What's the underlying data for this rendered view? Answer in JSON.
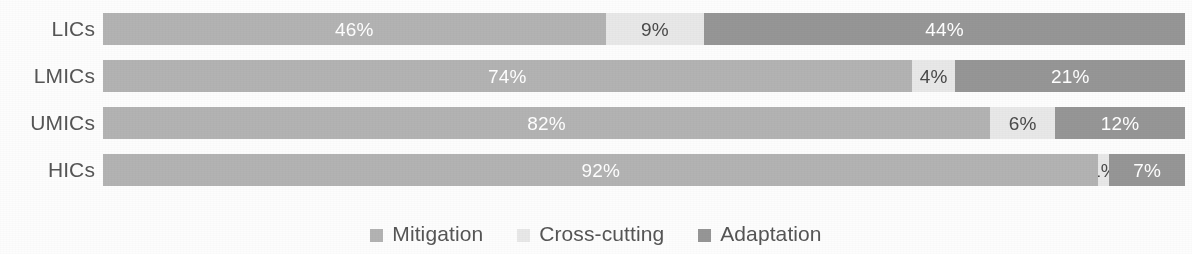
{
  "chart_data": {
    "type": "bar",
    "orientation": "horizontal",
    "stacked": true,
    "normalized_percent": true,
    "title": "",
    "subtitle": "",
    "xlabel": "",
    "ylabel": "",
    "xlim": [
      0,
      100
    ],
    "grid": false,
    "legend_position": "bottom-center",
    "categories": [
      "LICs",
      "LMICs",
      "UMICs",
      "HICs"
    ],
    "series": [
      {
        "name": "Mitigation",
        "color": "#b3b3b3",
        "values": [
          46,
          74,
          82,
          92
        ]
      },
      {
        "name": "Cross-cutting",
        "color": "#e8e8e8",
        "values": [
          9,
          4,
          6,
          1
        ]
      },
      {
        "name": "Adaptation",
        "color": "#969696",
        "values": [
          44,
          21,
          12,
          7
        ]
      }
    ],
    "data_labels": [
      {
        "category": "LICs",
        "labels": [
          "46%",
          "9%",
          "44%"
        ]
      },
      {
        "category": "LMICs",
        "labels": [
          "74%",
          "4%",
          "21%"
        ]
      },
      {
        "category": "UMICs",
        "labels": [
          "82%",
          "6%",
          "12%"
        ]
      },
      {
        "category": "HICs",
        "labels": [
          "92%",
          "1%",
          "7%"
        ]
      }
    ]
  },
  "rows": [
    {
      "label": "LICs",
      "segments": [
        {
          "series": "Mitigation",
          "value": 46,
          "label": "46%",
          "color": "#b3b3b3",
          "label_color": "light",
          "label_visible": true
        },
        {
          "series": "Cross-cutting",
          "value": 9,
          "label": "9%",
          "color": "#e8e8e8",
          "label_color": "dark",
          "label_visible": true
        },
        {
          "series": "Adaptation",
          "value": 44,
          "label": "44%",
          "color": "#969696",
          "label_color": "light",
          "label_visible": true
        }
      ]
    },
    {
      "label": "LMICs",
      "segments": [
        {
          "series": "Mitigation",
          "value": 74,
          "label": "74%",
          "color": "#b3b3b3",
          "label_color": "light",
          "label_visible": true
        },
        {
          "series": "Cross-cutting",
          "value": 4,
          "label": "4%",
          "color": "#e8e8e8",
          "label_color": "dark",
          "label_visible": true
        },
        {
          "series": "Adaptation",
          "value": 21,
          "label": "21%",
          "color": "#969696",
          "label_color": "light",
          "label_visible": true
        }
      ]
    },
    {
      "label": "UMICs",
      "segments": [
        {
          "series": "Mitigation",
          "value": 82,
          "label": "82%",
          "color": "#b3b3b3",
          "label_color": "light",
          "label_visible": true
        },
        {
          "series": "Cross-cutting",
          "value": 6,
          "label": "6%",
          "color": "#e8e8e8",
          "label_color": "dark",
          "label_visible": true
        },
        {
          "series": "Adaptation",
          "value": 12,
          "label": "12%",
          "color": "#969696",
          "label_color": "light",
          "label_visible": true
        }
      ]
    },
    {
      "label": "HICs",
      "segments": [
        {
          "series": "Mitigation",
          "value": 92,
          "label": "92%",
          "color": "#b3b3b3",
          "label_color": "light",
          "label_visible": true
        },
        {
          "series": "Cross-cutting",
          "value": 1,
          "label": "1%",
          "color": "#e8e8e8",
          "label_color": "dark",
          "label_visible": true
        },
        {
          "series": "Adaptation",
          "value": 7,
          "label": "7%",
          "color": "#969696",
          "label_color": "light",
          "label_visible": true
        }
      ]
    }
  ],
  "legend": {
    "items": [
      {
        "label": "Mitigation",
        "color": "#b3b3b3"
      },
      {
        "label": "Cross-cutting",
        "color": "#e8e8e8"
      },
      {
        "label": "Adaptation",
        "color": "#969696"
      }
    ]
  }
}
